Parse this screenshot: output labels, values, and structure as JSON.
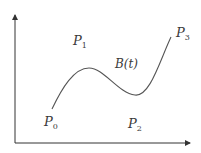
{
  "diagram": {
    "curve_label": "B(t)",
    "points": [
      {
        "name": "P",
        "sub": "0"
      },
      {
        "name": "P",
        "sub": "1"
      },
      {
        "name": "P",
        "sub": "2"
      },
      {
        "name": "P",
        "sub": "3"
      }
    ],
    "colors": {
      "axis": "#333333",
      "curve": "#555555",
      "text": "#3a3a3a",
      "background": "#ffffff"
    }
  }
}
